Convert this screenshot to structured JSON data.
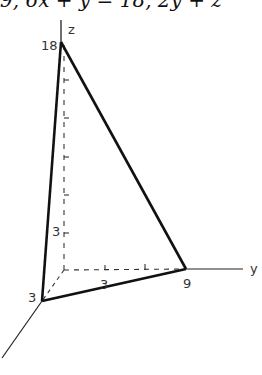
{
  "header": {
    "equation_fragment": "9, 6x + y = 18, 2y + z"
  },
  "diagram": {
    "type": "3d-coordinate-tetrahedron",
    "axes": {
      "x_label": "",
      "y_label": "y",
      "z_label": "z"
    },
    "intercepts": {
      "x": "3",
      "y": "9",
      "z": "18"
    },
    "tick_labels": {
      "z_tick": "3",
      "y_tick": "3"
    }
  }
}
